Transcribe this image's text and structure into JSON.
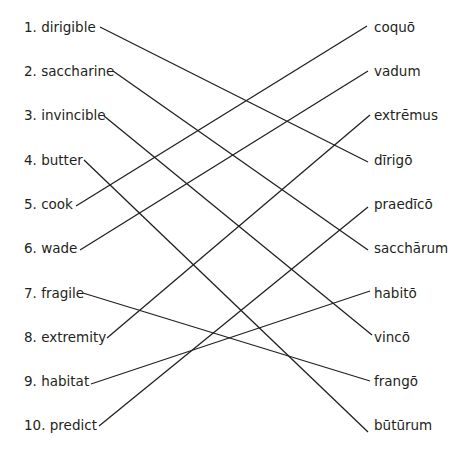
{
  "exercise": {
    "english_words": [
      {
        "label": "1. dirigible",
        "y": 27
      },
      {
        "label": "2. saccharine",
        "y": 71
      },
      {
        "label": "3. invincible",
        "y": 115
      },
      {
        "label": "4. butter",
        "y": 160
      },
      {
        "label": "5. cook",
        "y": 204
      },
      {
        "label": "6. wade",
        "y": 248
      },
      {
        "label": "7. fragile",
        "y": 293
      },
      {
        "label": "8. extremity",
        "y": 337
      },
      {
        "label": "9. habitat",
        "y": 381
      },
      {
        "label": "10. predict",
        "y": 425
      }
    ],
    "latin_words": [
      {
        "label": "coquō",
        "y": 27
      },
      {
        "label": "vadum",
        "y": 71
      },
      {
        "label": "extrēmus",
        "y": 115
      },
      {
        "label": "dīrigō",
        "y": 160
      },
      {
        "label": "praedīcō",
        "y": 204
      },
      {
        "label": "sacchārum",
        "y": 248
      },
      {
        "label": "habitō",
        "y": 293
      },
      {
        "label": "vincō",
        "y": 337
      },
      {
        "label": "frangō",
        "y": 381
      },
      {
        "label": "būtūrum",
        "y": 425
      }
    ],
    "connections": [
      {
        "from": 1,
        "to": "dīrigō"
      },
      {
        "from": 2,
        "to": "sacchārum"
      },
      {
        "from": 3,
        "to": "vincō"
      },
      {
        "from": 4,
        "to": "būtūrum"
      },
      {
        "from": 5,
        "to": "coquō"
      },
      {
        "from": 6,
        "to": "vadum"
      },
      {
        "from": 7,
        "to": "frangō"
      },
      {
        "from": 8,
        "to": "extrēmus"
      },
      {
        "from": 9,
        "to": "habitō"
      },
      {
        "from": 10,
        "to": "praedīcō"
      }
    ],
    "line_color": "#231f20"
  }
}
